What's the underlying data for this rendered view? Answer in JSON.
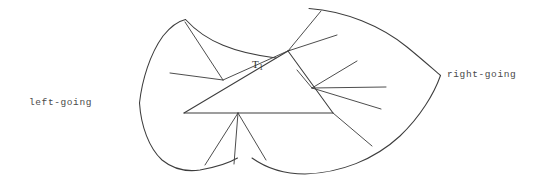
{
  "figure": {
    "kind": "mathematical-diagram",
    "background_color": "#ffffff",
    "stroke_color": "#3d3d3d",
    "labels": {
      "left": "left-going",
      "right": "right-going",
      "triangle": "T",
      "triangle_subscript": "1"
    },
    "geometry": {
      "left_cusp": [
        139,
        103
      ],
      "right_cusp": [
        440,
        75
      ],
      "triangle_vertices": [
        [
          184,
          113
        ],
        [
          288,
          51
        ],
        [
          333,
          113
        ]
      ],
      "fan_origins": {
        "upper_left_node": [
          223,
          80
        ],
        "apex_node": [
          288,
          51
        ],
        "right_node": [
          313,
          88
        ],
        "base_node": [
          238,
          113
        ],
        "right_vertex_node": [
          333,
          113
        ]
      }
    },
    "outline_paths": [
      "M139,103 C145,68 163,33 185,20 C215,35 250,44 288,51",
      "M310,8 C360,14 410,40 440,75",
      "M440,75 C430,108 400,140 352,160 C320,172 282,170 252,157",
      "M139,103 C143,135 160,158 186,167 C206,172 224,168 237,159"
    ],
    "segments": [
      {
        "from": [
          185,
          22
        ],
        "to": [
          223,
          80
        ],
        "name": "upper-left-fan-1"
      },
      {
        "from": [
          170,
          73
        ],
        "to": [
          223,
          80
        ],
        "name": "upper-left-fan-2"
      },
      {
        "from": [
          223,
          80
        ],
        "to": [
          288,
          51
        ],
        "name": "upper-left-fan-3"
      },
      {
        "from": [
          288,
          51
        ],
        "to": [
          322,
          11
        ],
        "name": "apex-fan-1"
      },
      {
        "from": [
          288,
          51
        ],
        "to": [
          337,
          36
        ],
        "name": "apex-fan-2"
      },
      {
        "from": [
          313,
          88
        ],
        "to": [
          358,
          62
        ],
        "name": "right-fan-1"
      },
      {
        "from": [
          313,
          88
        ],
        "to": [
          385,
          87
        ],
        "name": "right-fan-2"
      },
      {
        "from": [
          313,
          88
        ],
        "to": [
          381,
          108
        ],
        "name": "right-fan-3"
      },
      {
        "from": [
          333,
          113
        ],
        "to": [
          372,
          145
        ],
        "name": "right-vertex-fan-1"
      },
      {
        "from": [
          238,
          113
        ],
        "to": [
          205,
          165
        ],
        "name": "base-fan-1"
      },
      {
        "from": [
          238,
          113
        ],
        "to": [
          234,
          164
        ],
        "name": "base-fan-2"
      },
      {
        "from": [
          238,
          113
        ],
        "to": [
          265,
          160
        ],
        "name": "base-fan-3"
      }
    ]
  }
}
